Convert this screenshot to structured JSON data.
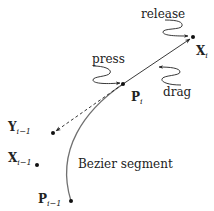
{
  "diagram": {
    "colors": {
      "ink": "#222222",
      "curve": "#707070",
      "background": "#ffffff"
    },
    "points": {
      "X_i": {
        "base": "X",
        "sub": "i",
        "x": 193,
        "y": 37
      },
      "P_i": {
        "base": "P",
        "sub": "i",
        "x": 123,
        "y": 84
      },
      "Y_im1": {
        "base": "Y",
        "sub": "i−1",
        "x": 53,
        "y": 133
      },
      "X_im1": {
        "base": "X",
        "sub": "i−1",
        "x": 37,
        "y": 165
      },
      "P_im1": {
        "base": "P",
        "sub": "i−1",
        "x": 71,
        "y": 201
      }
    },
    "events": {
      "press": "press",
      "drag": "drag",
      "release": "release"
    },
    "curve_label": "Bezier segment"
  }
}
